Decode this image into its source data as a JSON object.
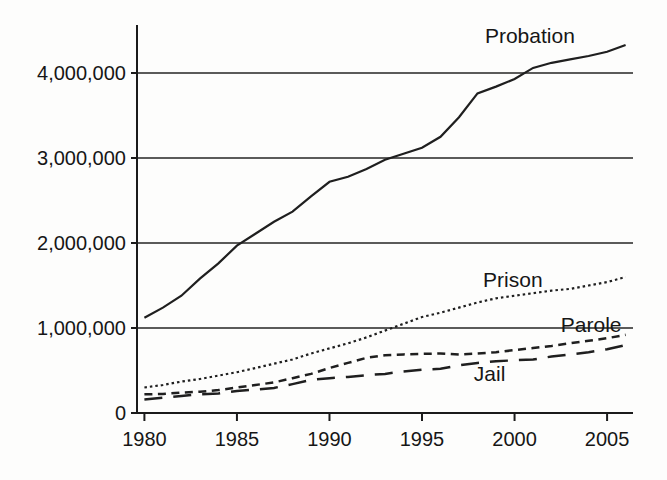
{
  "figure": {
    "background_color": "#fdfdfc",
    "ink_color": "#1c1c1c"
  },
  "chart_data": {
    "type": "line",
    "title": "",
    "xlabel": "",
    "ylabel": "",
    "x_ticks": [
      1980,
      1985,
      1990,
      1995,
      2000,
      2005
    ],
    "y_ticks": [
      0,
      1000000,
      2000000,
      3000000,
      4000000
    ],
    "y_tick_labels": [
      "0",
      "1,000,000",
      "2,000,000",
      "3,000,000",
      "4,000,000"
    ],
    "xlim": [
      1979.6,
      2006.4
    ],
    "ylim": [
      0,
      4565000
    ],
    "grid": "horizontal-only",
    "legend": "inline-series-labels",
    "series": [
      {
        "name": "Probation",
        "style": "solid",
        "label_at": {
          "x": 1998.4,
          "y": 4430000
        },
        "points": [
          [
            1980,
            1120000
          ],
          [
            1981,
            1240000
          ],
          [
            1982,
            1380000
          ],
          [
            1983,
            1580000
          ],
          [
            1984,
            1760000
          ],
          [
            1985,
            1970000
          ],
          [
            1986,
            2110000
          ],
          [
            1987,
            2250000
          ],
          [
            1988,
            2370000
          ],
          [
            1989,
            2550000
          ],
          [
            1990,
            2720000
          ],
          [
            1991,
            2780000
          ],
          [
            1992,
            2870000
          ],
          [
            1993,
            2980000
          ],
          [
            1994,
            3050000
          ],
          [
            1995,
            3120000
          ],
          [
            1996,
            3250000
          ],
          [
            1997,
            3480000
          ],
          [
            1998,
            3760000
          ],
          [
            1999,
            3840000
          ],
          [
            2000,
            3930000
          ],
          [
            2001,
            4060000
          ],
          [
            2002,
            4120000
          ],
          [
            2003,
            4160000
          ],
          [
            2004,
            4200000
          ],
          [
            2005,
            4250000
          ],
          [
            2006,
            4330000
          ]
        ]
      },
      {
        "name": "Prison",
        "style": "dotted",
        "label_at": {
          "x": 1998.3,
          "y": 1560000
        },
        "points": [
          [
            1980,
            300000
          ],
          [
            1981,
            330000
          ],
          [
            1982,
            370000
          ],
          [
            1983,
            400000
          ],
          [
            1984,
            440000
          ],
          [
            1985,
            480000
          ],
          [
            1986,
            530000
          ],
          [
            1987,
            580000
          ],
          [
            1988,
            630000
          ],
          [
            1989,
            700000
          ],
          [
            1990,
            760000
          ],
          [
            1991,
            820000
          ],
          [
            1992,
            890000
          ],
          [
            1993,
            970000
          ],
          [
            1994,
            1050000
          ],
          [
            1995,
            1130000
          ],
          [
            1996,
            1180000
          ],
          [
            1997,
            1240000
          ],
          [
            1998,
            1300000
          ],
          [
            1999,
            1350000
          ],
          [
            2000,
            1380000
          ],
          [
            2001,
            1410000
          ],
          [
            2002,
            1440000
          ],
          [
            2003,
            1460000
          ],
          [
            2004,
            1500000
          ],
          [
            2005,
            1540000
          ],
          [
            2006,
            1600000
          ]
        ]
      },
      {
        "name": "Parole",
        "style": "short-dash",
        "label_at": {
          "x": 2002.5,
          "y": 1040000
        },
        "points": [
          [
            1980,
            220000
          ],
          [
            1981,
            225000
          ],
          [
            1982,
            240000
          ],
          [
            1983,
            250000
          ],
          [
            1984,
            270000
          ],
          [
            1985,
            300000
          ],
          [
            1986,
            330000
          ],
          [
            1987,
            360000
          ],
          [
            1988,
            410000
          ],
          [
            1989,
            460000
          ],
          [
            1990,
            530000
          ],
          [
            1991,
            590000
          ],
          [
            1992,
            650000
          ],
          [
            1993,
            680000
          ],
          [
            1994,
            690000
          ],
          [
            1995,
            695000
          ],
          [
            1996,
            700000
          ],
          [
            1997,
            690000
          ],
          [
            1998,
            700000
          ],
          [
            1999,
            715000
          ],
          [
            2000,
            740000
          ],
          [
            2001,
            765000
          ],
          [
            2002,
            790000
          ],
          [
            2003,
            820000
          ],
          [
            2004,
            850000
          ],
          [
            2005,
            880000
          ],
          [
            2006,
            920000
          ]
        ]
      },
      {
        "name": "Jail",
        "style": "long-dash",
        "label_at": {
          "x": 1997.8,
          "y": 460000
        },
        "points": [
          [
            1980,
            160000
          ],
          [
            1981,
            180000
          ],
          [
            1982,
            200000
          ],
          [
            1983,
            220000
          ],
          [
            1984,
            230000
          ],
          [
            1985,
            260000
          ],
          [
            1986,
            275000
          ],
          [
            1987,
            295000
          ],
          [
            1988,
            340000
          ],
          [
            1989,
            390000
          ],
          [
            1990,
            410000
          ],
          [
            1991,
            425000
          ],
          [
            1992,
            445000
          ],
          [
            1993,
            460000
          ],
          [
            1994,
            490000
          ],
          [
            1995,
            510000
          ],
          [
            1996,
            520000
          ],
          [
            1997,
            560000
          ],
          [
            1998,
            590000
          ],
          [
            1999,
            610000
          ],
          [
            2000,
            620000
          ],
          [
            2001,
            630000
          ],
          [
            2002,
            665000
          ],
          [
            2003,
            690000
          ],
          [
            2004,
            715000
          ],
          [
            2005,
            750000
          ],
          [
            2006,
            800000
          ]
        ]
      }
    ]
  }
}
